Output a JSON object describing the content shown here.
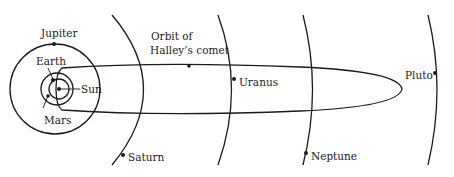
{
  "diagram": {
    "labels": {
      "sun": "Sun",
      "earth": "Earth",
      "mars": "Mars",
      "jupiter": "Jupiter",
      "saturn": "Saturn",
      "uranus": "Uranus",
      "neptune": "Neptune",
      "pluto": "Pluto",
      "halley_line1": "Orbit of",
      "halley_line2": "Halley’s comet"
    },
    "colors": {
      "stroke": "#1a1a1a",
      "background": "#ffffff"
    }
  }
}
